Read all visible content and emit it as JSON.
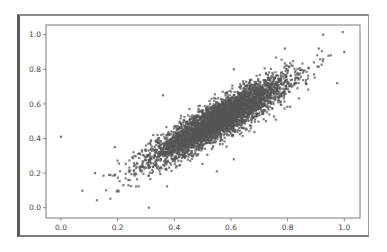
{
  "chart_data": {
    "type": "scatter",
    "title": "",
    "xlabel": "",
    "ylabel": "",
    "xlim": [
      -0.05,
      1.05
    ],
    "ylim": [
      -0.05,
      1.05
    ],
    "xticks": [
      0.0,
      0.2,
      0.4,
      0.6,
      0.8,
      1.0
    ],
    "yticks": [
      0.0,
      0.2,
      0.4,
      0.6,
      0.8,
      1.0
    ],
    "xtick_labels": [
      "0.0",
      "0.2",
      "0.4",
      "0.6",
      "0.8",
      "1.0"
    ],
    "ytick_labels": [
      "0.0",
      "0.2",
      "0.4",
      "0.6",
      "0.8",
      "1.0"
    ],
    "grid": false,
    "legend": null,
    "marker_color": "#555555",
    "marker_size": 1.6,
    "distribution": {
      "kind": "bivariate_normal",
      "n_points": 4500,
      "mean_x": 0.56,
      "mean_y": 0.51,
      "sd_x": 0.12,
      "sd_y": 0.12,
      "correlation": 0.9
    },
    "outliers": [
      {
        "x": 0.925,
        "y": 1.0
      },
      {
        "x": 1.0,
        "y": 0.9
      },
      {
        "x": 0.79,
        "y": 0.92
      },
      {
        "x": 0.975,
        "y": 0.72
      },
      {
        "x": 0.91,
        "y": 0.92
      },
      {
        "x": 0.0,
        "y": 0.41
      },
      {
        "x": 0.31,
        "y": 0.0
      },
      {
        "x": 0.12,
        "y": 0.2
      },
      {
        "x": 0.15,
        "y": 0.185
      },
      {
        "x": 0.17,
        "y": 0.19
      },
      {
        "x": 0.19,
        "y": 0.35
      },
      {
        "x": 0.2,
        "y": 0.1
      },
      {
        "x": 0.22,
        "y": 0.13
      },
      {
        "x": 0.36,
        "y": 0.65
      },
      {
        "x": 0.61,
        "y": 0.8
      },
      {
        "x": 0.55,
        "y": 0.21
      },
      {
        "x": 0.61,
        "y": 0.28
      }
    ]
  },
  "axes": {
    "frame_color": "#555555",
    "axis_color": "#666666"
  }
}
